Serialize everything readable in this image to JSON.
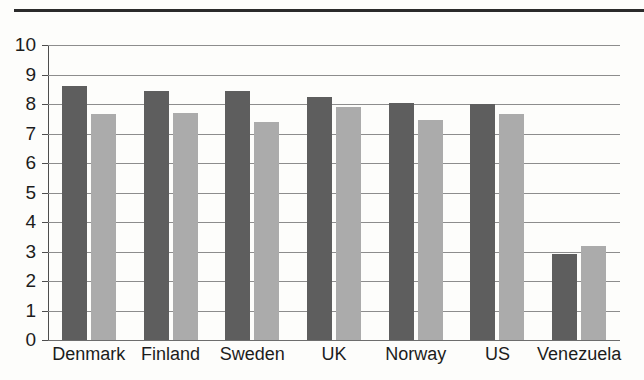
{
  "chart_data": {
    "type": "bar",
    "title": "",
    "subtitle": "",
    "xlabel": "",
    "ylabel": "",
    "ylim": [
      0,
      10
    ],
    "ytick_step": 1,
    "yticks": [
      "10",
      "9",
      "8",
      "7",
      "6",
      "5",
      "4",
      "3",
      "2",
      "1",
      "0"
    ],
    "grid": true,
    "legend": "none",
    "categories": [
      "Denmark",
      "Finland",
      "Sweden",
      "UK",
      "Norway",
      "US",
      "Venezuela"
    ],
    "series": [
      {
        "name": "series-1",
        "color": "#5e5e5e",
        "values": [
          8.6,
          8.45,
          8.45,
          8.25,
          8.05,
          8.0,
          2.9
        ]
      },
      {
        "name": "series-2",
        "color": "#ababab",
        "values": [
          7.65,
          7.7,
          7.4,
          7.9,
          7.45,
          7.65,
          3.2
        ]
      }
    ]
  },
  "figure": {
    "top_rule_color": "#2b2b2b",
    "background_color": "#fdfdfb",
    "gridline_color": "#8d8d8d",
    "axis_color": "#4d4d4d"
  }
}
